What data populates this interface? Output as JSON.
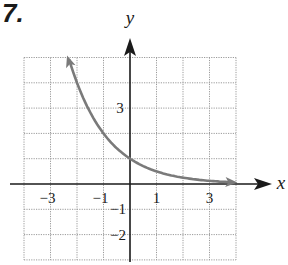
{
  "problem_number": "7.",
  "chart_data": {
    "type": "line",
    "title": "",
    "xlabel": "x",
    "ylabel": "y",
    "xlim": [
      -4,
      4
    ],
    "ylim": [
      -3,
      5
    ],
    "grid": true,
    "grid_style": "dotted",
    "x_ticks_labeled": [
      {
        "value": -3,
        "label": "−3"
      },
      {
        "value": -1,
        "label": "−1"
      },
      {
        "value": 1,
        "label": "1"
      },
      {
        "value": 3,
        "label": "3"
      }
    ],
    "y_ticks_labeled": [
      {
        "value": 3,
        "label": "3"
      },
      {
        "value": -1,
        "label": "−1"
      },
      {
        "value": -2,
        "label": "−2"
      }
    ],
    "series": [
      {
        "name": "y = (1/2)^x",
        "color": "#7a7a7a",
        "arrows": "both",
        "x": [
          -2.3,
          -2,
          -1.5,
          -1,
          -0.5,
          0,
          0.5,
          1,
          1.5,
          2,
          2.5,
          3,
          3.5,
          4
        ],
        "values": [
          4.92,
          4.0,
          2.83,
          2.0,
          1.41,
          1.0,
          0.71,
          0.5,
          0.35,
          0.25,
          0.18,
          0.125,
          0.09,
          0.06
        ]
      }
    ]
  },
  "colors": {
    "axis": "#1a1a1a",
    "grid": "#9a9a9a",
    "curve": "#7a7a7a"
  }
}
